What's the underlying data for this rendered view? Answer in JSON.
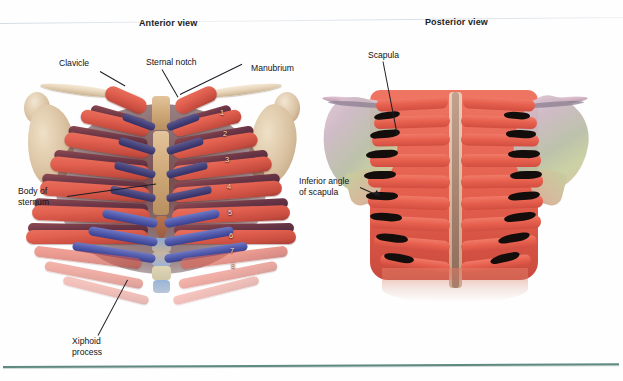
{
  "figure": {
    "panels": [
      {
        "id": "anterior",
        "title": "Anterior view"
      },
      {
        "id": "posterior",
        "title": "Posterior view"
      }
    ],
    "labels": {
      "clavicle": "Clavicle",
      "sternal_notch_line1": "Sternal notch",
      "manubrium": "Manubrium",
      "body_of_sternum_line1": "Body of",
      "body_of_sternum_line2": "sternum",
      "xiphoid_line1": "Xiphoid",
      "xiphoid_line2": "process",
      "scapula": "Scapula",
      "inferior_angle_line1": "Inferior angle",
      "inferior_angle_line2": "of scapula"
    },
    "rib_numbers": [
      "1",
      "2",
      "3",
      "4",
      "5",
      "6",
      "7",
      "8"
    ],
    "colors": {
      "rule": "#5f8a80",
      "rib_red": "#e2604f",
      "costal_cartilage": "#46427a",
      "costal_cartilage_blue": "#4f57a8",
      "bone_tan": "#d9c1a0",
      "scapula_posterior": "#c9cf9f",
      "text": "#111318",
      "background": "#ffffff"
    }
  }
}
